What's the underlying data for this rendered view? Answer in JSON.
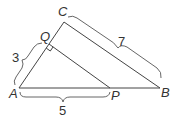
{
  "diagram": {
    "title": "",
    "points": {
      "A": {
        "label": "A",
        "x": 19,
        "y": 88
      },
      "B": {
        "label": "B",
        "x": 160,
        "y": 88
      },
      "C": {
        "label": "C",
        "x": 64,
        "y": 22
      },
      "P": {
        "label": "P",
        "x": 110,
        "y": 88
      },
      "Q": {
        "label": "Q",
        "x": 49,
        "y": 44
      }
    },
    "segments": [
      {
        "from": "A",
        "to": "B"
      },
      {
        "from": "A",
        "to": "C"
      },
      {
        "from": "C",
        "to": "B"
      },
      {
        "from": "Q",
        "to": "P"
      }
    ],
    "right_angle_at": "Q",
    "measurements": {
      "AQ": "3",
      "CB": "7",
      "AP": "5"
    }
  }
}
